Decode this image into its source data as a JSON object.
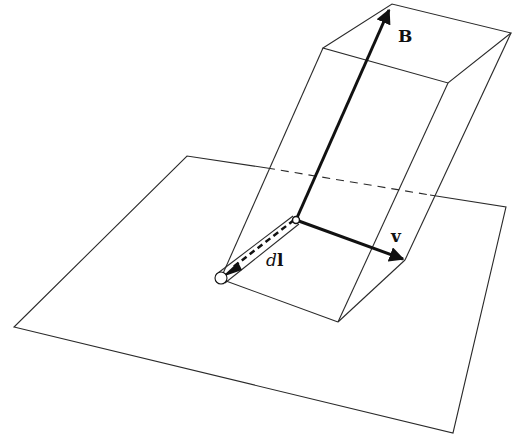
{
  "diagram": {
    "labels": {
      "B": "B",
      "v": "v",
      "dl_d": "d",
      "dl_l": "l"
    },
    "vectors": [
      {
        "name": "B",
        "style": "bold",
        "direction": "up along slanted box edge"
      },
      {
        "name": "v",
        "style": "bold",
        "direction": "right-down along bottom edge"
      },
      {
        "name": "dl",
        "style": "dashed double-line",
        "direction": "left-down from origin"
      }
    ],
    "colors": {
      "line": "#2a2a2a",
      "arrow": "#111111",
      "background": "#ffffff"
    }
  }
}
